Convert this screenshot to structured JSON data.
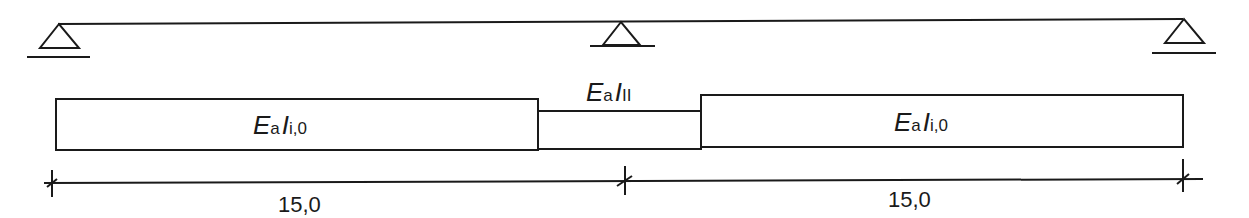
{
  "diagram": {
    "type": "two-span continuous beam with stiffness distribution",
    "colors": {
      "stroke": "#1a1a1a",
      "background": "#ffffff"
    },
    "supports": [
      {
        "id": "support-left",
        "kind": "pinned"
      },
      {
        "id": "support-middle",
        "kind": "pinned"
      },
      {
        "id": "support-right",
        "kind": "pinned"
      }
    ],
    "stiffness_zones": [
      {
        "id": "zone-left",
        "symbol": "E",
        "symbol_sub": "a",
        "inertia": "I",
        "inertia_sub": "i,0"
      },
      {
        "id": "zone-middle",
        "symbol": "E",
        "symbol_sub": "a",
        "inertia": "I",
        "inertia_sub": "II"
      },
      {
        "id": "zone-right",
        "symbol": "E",
        "symbol_sub": "a",
        "inertia": "I",
        "inertia_sub": "i,0"
      }
    ],
    "spans": [
      {
        "id": "span-1",
        "length": "15,0"
      },
      {
        "id": "span-2",
        "length": "15,0"
      }
    ]
  }
}
